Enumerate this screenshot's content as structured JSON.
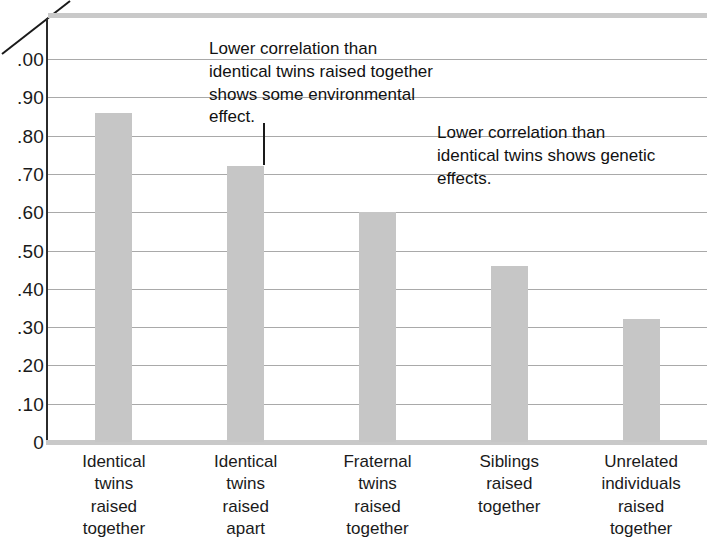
{
  "chart_data": {
    "type": "bar",
    "title": "",
    "subtitle": "",
    "xlabel": "",
    "ylabel": "",
    "ylim": [
      0,
      1.0
    ],
    "grid": true,
    "legend": "none",
    "categories": [
      "Identical\ntwins\nraised\ntogether",
      "Identical\ntwins\nraised\napart",
      "Fraternal\ntwins\nraised\ntogether",
      "Siblings\nraised\ntogether",
      "Unrelated\nindividuals\nraised\ntogether"
    ],
    "values": [
      0.86,
      0.72,
      0.6,
      0.46,
      0.32
    ],
    "ytick_labels": [
      ".00",
      ".90",
      ".80",
      ".70",
      ".60",
      ".50",
      ".40",
      ".30",
      ".20",
      ".10",
      "0"
    ],
    "ytick_values": [
      1.0,
      0.9,
      0.8,
      0.7,
      0.6,
      0.5,
      0.4,
      0.3,
      0.2,
      0.1,
      0.0
    ],
    "annotations": [
      {
        "text": "Lower correlation than identical twins raised together shows some environmental effect.",
        "target_category_index": 1,
        "leader": "vertical"
      },
      {
        "text": "Lower correlation than identical twins shows genetic effects.",
        "target_category_index": 2,
        "leader": "diagonal"
      }
    ],
    "colors": {
      "bar_fill": "#c6c6c6",
      "gridline": "#a9a9a9",
      "axis_line": "#2b2b2b",
      "baseline": "#c9c9c9",
      "text": "#1a1a1a",
      "background": "#ffffff"
    }
  }
}
